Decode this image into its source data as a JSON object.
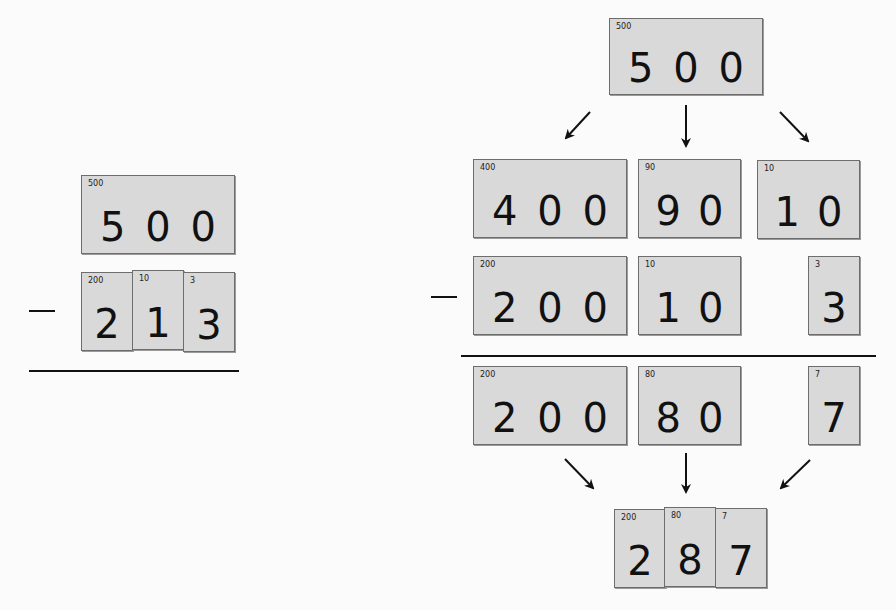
{
  "left_problem": {
    "minuend": {
      "label": "500",
      "digits": "5 0 0"
    },
    "operator": "−",
    "subtrahend": [
      {
        "label": "200",
        "digit": "2"
      },
      {
        "label": "10",
        "digit": "1"
      },
      {
        "label": "3",
        "digit": "3"
      }
    ]
  },
  "right_problem": {
    "top": {
      "label": "500",
      "digits": "5 0 0"
    },
    "regrouped": [
      {
        "label": "400",
        "digits": "4 0 0"
      },
      {
        "label": "90",
        "digits": "9 0"
      },
      {
        "label": "10",
        "digits": "1 0"
      }
    ],
    "operator": "−",
    "subtrahend": [
      {
        "label": "200",
        "digits": "2 0 0"
      },
      {
        "label": "10",
        "digits": "1 0"
      },
      {
        "label": "3",
        "digits": "3"
      }
    ],
    "differences": [
      {
        "label": "200",
        "digits": "2 0 0"
      },
      {
        "label": "80",
        "digits": "8 0"
      },
      {
        "label": "7",
        "digits": "7"
      }
    ],
    "result": [
      {
        "label": "200",
        "digit": "2"
      },
      {
        "label": "80",
        "digit": "8"
      },
      {
        "label": "7",
        "digit": "7"
      }
    ]
  }
}
